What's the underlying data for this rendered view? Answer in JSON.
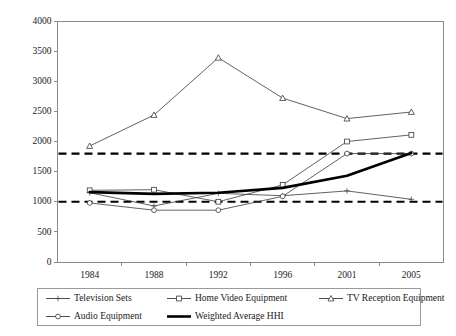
{
  "chart_data": {
    "type": "line",
    "title": "",
    "subtitle": "",
    "xlabel": "",
    "ylabel": "",
    "categories": [
      "1984",
      "1988",
      "1992",
      "1996",
      "2001",
      "2005"
    ],
    "ylim": [
      0,
      4000
    ],
    "yticks": [
      0,
      500,
      1000,
      1500,
      2000,
      2500,
      3000,
      3500,
      4000
    ],
    "ytick_labels": [
      "0",
      "500",
      "1000",
      "1500",
      "2000",
      "2500",
      "3000",
      "3500",
      "4000"
    ],
    "grid": false,
    "legend_position": "bottom",
    "series": [
      {
        "name": "Television Sets",
        "marker": "plus-cross",
        "style": "thin-line",
        "color": "#3a3a3a",
        "values": [
          1150,
          930,
          1140,
          1100,
          1180,
          1040
        ]
      },
      {
        "name": "Home Video Equipment",
        "marker": "square",
        "style": "thin-line",
        "color": "#3a3a3a",
        "values": [
          1190,
          1200,
          1000,
          1280,
          2000,
          2110
        ]
      },
      {
        "name": "TV Reception Equipment",
        "marker": "triangle",
        "style": "thin-line",
        "color": "#3a3a3a",
        "values": [
          1925,
          2440,
          3390,
          2720,
          2380,
          2490
        ]
      },
      {
        "name": "Audio Equipment",
        "marker": "circle",
        "style": "thin-line",
        "color": "#3a3a3a",
        "values": [
          980,
          860,
          860,
          1090,
          1800,
          1800
        ]
      },
      {
        "name": "Weighted Average HHI",
        "marker": "none",
        "style": "bold-line",
        "color": "#000000",
        "values": [
          1160,
          1130,
          1150,
          1230,
          1430,
          1810
        ]
      }
    ],
    "reference_lines": [
      {
        "name": "upper-threshold",
        "value": 1800,
        "style": "dashed"
      },
      {
        "name": "lower-threshold",
        "value": 1000,
        "style": "dashed"
      }
    ]
  },
  "legend": {
    "rows": [
      [
        {
          "label": "Television Sets",
          "marker": "plus-cross",
          "series": 0
        },
        {
          "label": "Home Video Equipment",
          "marker": "square",
          "series": 1
        },
        {
          "label": "TV Reception Equipment",
          "marker": "triangle",
          "series": 2
        }
      ],
      [
        {
          "label": "Audio Equipment",
          "marker": "circle",
          "series": 3
        },
        {
          "label": "Weighted Average HHI",
          "marker": "none",
          "series": 4
        }
      ]
    ]
  }
}
